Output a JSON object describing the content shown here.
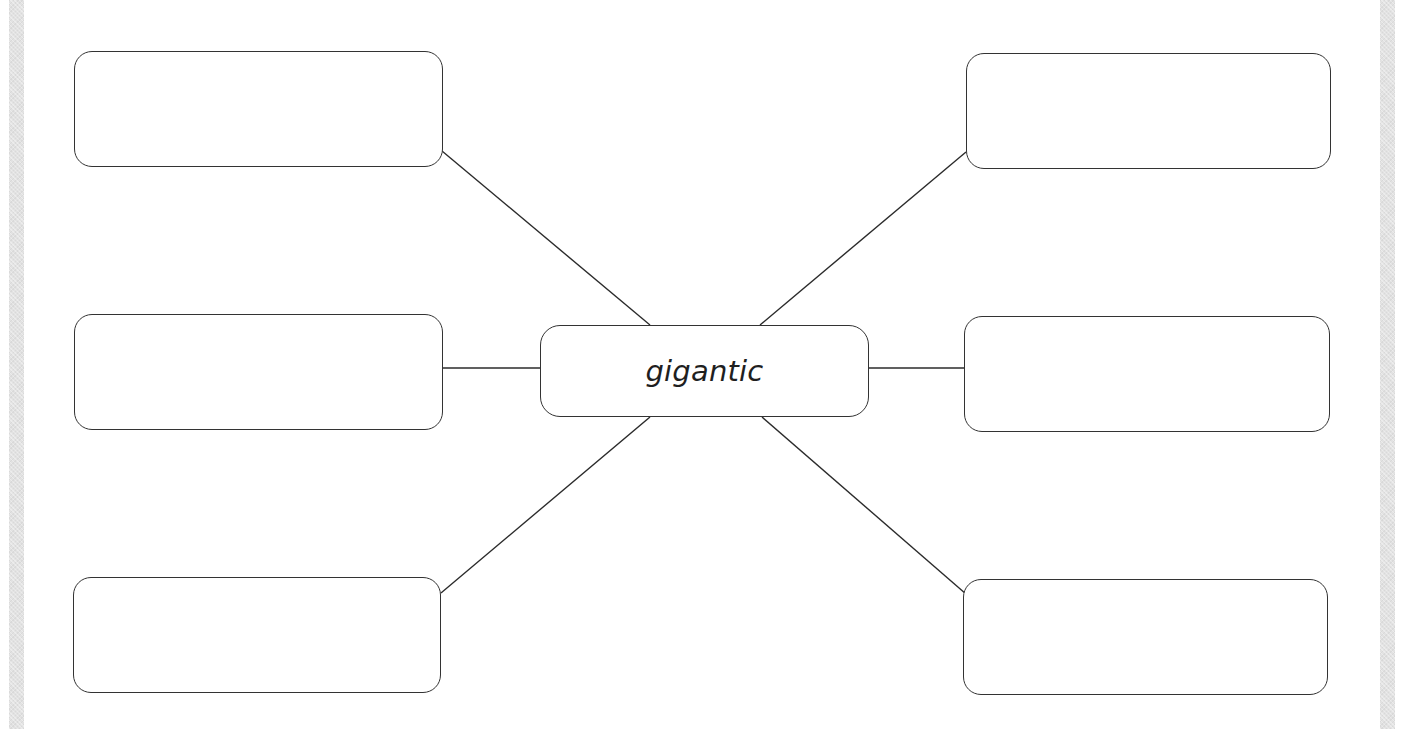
{
  "diagram": {
    "type": "word-web / mind-map graphic organizer",
    "center": {
      "text": "gigantic",
      "box": {
        "x": 540,
        "y": 325,
        "w": 329,
        "h": 92
      }
    },
    "outer_boxes": [
      {
        "id": "top-left",
        "text": "",
        "box": {
          "x": 74,
          "y": 51,
          "w": 369,
          "h": 116
        }
      },
      {
        "id": "middle-left",
        "text": "",
        "box": {
          "x": 74,
          "y": 314,
          "w": 369,
          "h": 116
        }
      },
      {
        "id": "bottom-left",
        "text": "",
        "box": {
          "x": 73,
          "y": 577,
          "w": 368,
          "h": 116
        }
      },
      {
        "id": "top-right",
        "text": "",
        "box": {
          "x": 966,
          "y": 53,
          "w": 365,
          "h": 116
        }
      },
      {
        "id": "middle-right",
        "text": "",
        "box": {
          "x": 964,
          "y": 316,
          "w": 366,
          "h": 116
        }
      },
      {
        "id": "bottom-right",
        "text": "",
        "box": {
          "x": 963,
          "y": 579,
          "w": 365,
          "h": 116
        }
      }
    ],
    "connectors": [
      {
        "from": "top-left",
        "x1": 442,
        "y1": 151,
        "x2": 650,
        "y2": 325
      },
      {
        "from": "middle-left",
        "x1": 443,
        "y1": 368,
        "x2": 540,
        "y2": 368
      },
      {
        "from": "bottom-left",
        "x1": 441,
        "y1": 593,
        "x2": 650,
        "y2": 417
      },
      {
        "from": "top-right",
        "x1": 966,
        "y1": 152,
        "x2": 760,
        "y2": 325
      },
      {
        "from": "middle-right",
        "x1": 869,
        "y1": 368,
        "x2": 964,
        "y2": 368
      },
      {
        "from": "bottom-right",
        "x1": 966,
        "y1": 594,
        "x2": 762,
        "y2": 417
      }
    ],
    "colors": {
      "stroke": "#333333",
      "text": "#1f1f1f",
      "background": "#ffffff",
      "side_strip": "#e2e2e2"
    }
  }
}
